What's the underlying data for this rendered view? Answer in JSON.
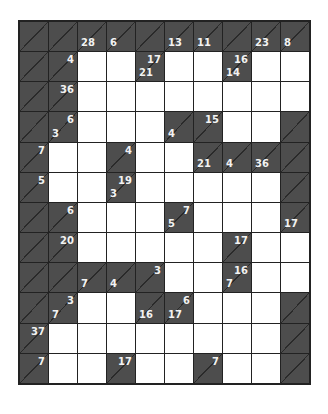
{
  "puzzle": {
    "type": "kakuro",
    "rows": 12,
    "cols": 10,
    "colors": {
      "black_cell": "#4d4d4d",
      "white_cell": "#ffffff",
      "grid_line": "#222222",
      "clue_text": "#f2f2f2"
    },
    "grid": [
      [
        {
          "t": "b"
        },
        {
          "t": "b"
        },
        {
          "t": "b",
          "d": "28"
        },
        {
          "t": "b",
          "d": "6"
        },
        {
          "t": "b"
        },
        {
          "t": "b",
          "d": "13"
        },
        {
          "t": "b",
          "d": "11"
        },
        {
          "t": "b"
        },
        {
          "t": "b",
          "d": "23"
        },
        {
          "t": "b",
          "d": "8"
        }
      ],
      [
        {
          "t": "b"
        },
        {
          "t": "b",
          "r": "4"
        },
        {
          "t": "w"
        },
        {
          "t": "w"
        },
        {
          "t": "b",
          "r": "17",
          "d": "21"
        },
        {
          "t": "w"
        },
        {
          "t": "w"
        },
        {
          "t": "b",
          "r": "16",
          "d": "14"
        },
        {
          "t": "w"
        },
        {
          "t": "w"
        }
      ],
      [
        {
          "t": "b"
        },
        {
          "t": "b",
          "r": "36"
        },
        {
          "t": "w"
        },
        {
          "t": "w"
        },
        {
          "t": "w"
        },
        {
          "t": "w"
        },
        {
          "t": "w"
        },
        {
          "t": "w"
        },
        {
          "t": "w"
        },
        {
          "t": "w"
        }
      ],
      [
        {
          "t": "b"
        },
        {
          "t": "b",
          "r": "6",
          "d": "3"
        },
        {
          "t": "w"
        },
        {
          "t": "w"
        },
        {
          "t": "w"
        },
        {
          "t": "b",
          "d": "4"
        },
        {
          "t": "b",
          "r": "15"
        },
        {
          "t": "w"
        },
        {
          "t": "w"
        },
        {
          "t": "b"
        }
      ],
      [
        {
          "t": "b",
          "r": "7"
        },
        {
          "t": "w"
        },
        {
          "t": "w"
        },
        {
          "t": "b",
          "r": "4"
        },
        {
          "t": "w"
        },
        {
          "t": "w"
        },
        {
          "t": "b",
          "d": "21"
        },
        {
          "t": "b",
          "d": "4"
        },
        {
          "t": "b",
          "d": "36"
        },
        {
          "t": "b"
        }
      ],
      [
        {
          "t": "b",
          "r": "5"
        },
        {
          "t": "w"
        },
        {
          "t": "w"
        },
        {
          "t": "b",
          "r": "19",
          "d": "3"
        },
        {
          "t": "w"
        },
        {
          "t": "w"
        },
        {
          "t": "w"
        },
        {
          "t": "w"
        },
        {
          "t": "w"
        },
        {
          "t": "b"
        }
      ],
      [
        {
          "t": "b"
        },
        {
          "t": "b",
          "r": "6"
        },
        {
          "t": "w"
        },
        {
          "t": "w"
        },
        {
          "t": "w"
        },
        {
          "t": "b",
          "r": "7",
          "d": "5"
        },
        {
          "t": "w"
        },
        {
          "t": "w"
        },
        {
          "t": "w"
        },
        {
          "t": "b",
          "d": "17"
        }
      ],
      [
        {
          "t": "b"
        },
        {
          "t": "b",
          "r": "20"
        },
        {
          "t": "w"
        },
        {
          "t": "w"
        },
        {
          "t": "w"
        },
        {
          "t": "w"
        },
        {
          "t": "w"
        },
        {
          "t": "b",
          "r": "17"
        },
        {
          "t": "w"
        },
        {
          "t": "w"
        }
      ],
      [
        {
          "t": "b"
        },
        {
          "t": "b"
        },
        {
          "t": "b",
          "d": "7"
        },
        {
          "t": "b",
          "d": "4"
        },
        {
          "t": "b",
          "r": "3"
        },
        {
          "t": "w"
        },
        {
          "t": "w"
        },
        {
          "t": "b",
          "r": "16",
          "d": "7"
        },
        {
          "t": "w"
        },
        {
          "t": "w"
        }
      ],
      [
        {
          "t": "b"
        },
        {
          "t": "b",
          "r": "3",
          "d": "7"
        },
        {
          "t": "w"
        },
        {
          "t": "w"
        },
        {
          "t": "b",
          "d": "16"
        },
        {
          "t": "b",
          "r": "6",
          "d": "17"
        },
        {
          "t": "w"
        },
        {
          "t": "w"
        },
        {
          "t": "w"
        },
        {
          "t": "b"
        }
      ],
      [
        {
          "t": "b",
          "r": "37"
        },
        {
          "t": "w"
        },
        {
          "t": "w"
        },
        {
          "t": "w"
        },
        {
          "t": "w"
        },
        {
          "t": "w"
        },
        {
          "t": "w"
        },
        {
          "t": "w"
        },
        {
          "t": "w"
        },
        {
          "t": "b"
        }
      ],
      [
        {
          "t": "b",
          "r": "7"
        },
        {
          "t": "w"
        },
        {
          "t": "w"
        },
        {
          "t": "b",
          "r": "17"
        },
        {
          "t": "w"
        },
        {
          "t": "w"
        },
        {
          "t": "b",
          "r": "7"
        },
        {
          "t": "w"
        },
        {
          "t": "w"
        },
        {
          "t": "b"
        }
      ]
    ]
  }
}
